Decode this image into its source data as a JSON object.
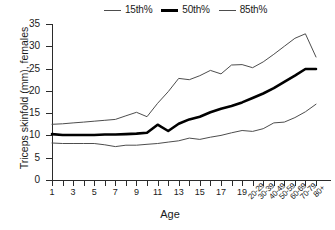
{
  "chart_data": {
    "type": "line",
    "title": "",
    "xlabel": "Age",
    "ylabel": "Triceps skinfold (mm), females",
    "ylim": [
      0,
      35
    ],
    "yticks": [
      0,
      5,
      10,
      15,
      20,
      25,
      30,
      35
    ],
    "grid": false,
    "legend_position": "top",
    "categories": [
      "1",
      "2",
      "3",
      "4",
      "5",
      "6",
      "7",
      "8",
      "9",
      "10",
      "11",
      "12",
      "13",
      "14",
      "15",
      "16",
      "17",
      "18",
      "19",
      "20-29",
      "30-39",
      "40-49",
      "50-59",
      "60-69",
      "70-79",
      "80+"
    ],
    "xtick_labels": [
      "1",
      "",
      "3",
      "",
      "5",
      "",
      "7",
      "",
      "9",
      "",
      "11",
      "",
      "13",
      "",
      "15",
      "",
      "17",
      "",
      "19",
      "20-29",
      "30-39",
      "40-49",
      "50-59",
      "60-69",
      "70-79",
      "80+"
    ],
    "series": [
      {
        "name": "85th%",
        "style": "thin",
        "color": "#4d4d4d",
        "values": [
          12.5,
          12.6,
          12.8,
          13.0,
          13.2,
          13.4,
          13.6,
          14.4,
          15.2,
          14.2,
          17.2,
          19.8,
          22.8,
          22.5,
          23.4,
          24.6,
          23.8,
          25.8,
          25.9,
          25.2,
          26.5,
          28.2,
          30.0,
          31.8,
          32.8,
          27.6
        ]
      },
      {
        "name": "50th%",
        "style": "thick",
        "color": "#000000",
        "values": [
          10.3,
          10.1,
          10.1,
          10.1,
          10.1,
          10.2,
          10.2,
          10.3,
          10.4,
          10.6,
          12.4,
          11.0,
          12.6,
          13.6,
          14.2,
          15.2,
          16.0,
          16.6,
          17.4,
          18.4,
          19.4,
          20.6,
          22.0,
          23.4,
          24.9,
          24.9
        ]
      },
      {
        "name": "15th%",
        "style": "thin",
        "color": "#4d4d4d",
        "values": [
          8.3,
          8.2,
          8.2,
          8.2,
          8.2,
          7.9,
          7.5,
          7.8,
          7.8,
          8.0,
          8.2,
          8.5,
          8.8,
          9.4,
          9.1,
          9.6,
          10.0,
          10.6,
          11.1,
          10.9,
          11.5,
          12.8,
          13.0,
          14.0,
          15.3,
          17.0
        ]
      }
    ],
    "legend": [
      {
        "label": "15th%",
        "style": "thin"
      },
      {
        "label": "50th%",
        "style": "thick"
      },
      {
        "label": "85th%",
        "style": "thin"
      }
    ]
  }
}
